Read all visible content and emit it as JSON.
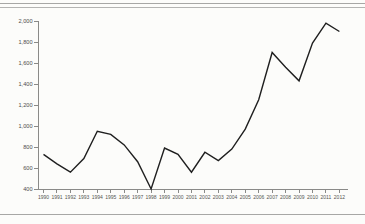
{
  "frame": {
    "top_rule_style": "double",
    "bottom_rule_style": "single",
    "rule_color": "#a7a7a5",
    "background_color": "#fcfcfa"
  },
  "chart_data": {
    "type": "line",
    "title": "",
    "xlabel": "",
    "ylabel": "",
    "grid": false,
    "legend_position": "none",
    "x": [
      1990,
      1991,
      1992,
      1993,
      1994,
      1995,
      1996,
      1997,
      1998,
      1999,
      2000,
      2001,
      2002,
      2003,
      2004,
      2005,
      2006,
      2007,
      2008,
      2009,
      2010,
      2011,
      2012
    ],
    "x_tick_labels": [
      "1990",
      "1991",
      "1992",
      "1993",
      "1994",
      "1995",
      "1996",
      "1997",
      "1998",
      "1999",
      "2000",
      "2001",
      "2002",
      "2003",
      "2004",
      "2005",
      "2006",
      "2007",
      "2008",
      "2009",
      "2010",
      "2011",
      "2012"
    ],
    "series": [
      {
        "name": "value",
        "values": [
          730,
          640,
          560,
          690,
          950,
          920,
          820,
          660,
          400,
          790,
          730,
          560,
          750,
          670,
          780,
          970,
          1250,
          1700,
          1560,
          1430,
          1790,
          1980,
          1900
        ]
      }
    ],
    "ylim": [
      400,
      2000
    ],
    "y_ticks": [
      400,
      600,
      800,
      1000,
      1200,
      1400,
      1600,
      1800,
      2000
    ],
    "y_tick_labels": [
      "400",
      "600",
      "800",
      "1,000",
      "1,200",
      "1,400",
      "1,600",
      "1,800",
      "2,000"
    ],
    "line_color": "#1f1f1f",
    "axis_color": "#8a8a88",
    "tick_color": "#8a8a88",
    "label_color": "#4d4d4d"
  }
}
